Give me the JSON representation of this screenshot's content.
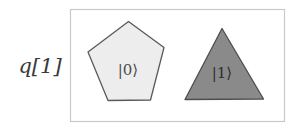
{
  "figure": {
    "title": "",
    "background_color": "#ffffff"
  },
  "qubit": {
    "label": "q[1]",
    "name": "q[1]"
  },
  "frame": {
    "name": "state-box",
    "border_color": "#c8c8c8",
    "fill_color": "#ffffff",
    "x": 70,
    "y": 9,
    "width": 215,
    "height": 113
  },
  "states": [
    {
      "id": "state-zero",
      "label": "|0⟩",
      "shape": "pentagon",
      "fill_color": "#ededed",
      "stroke_color": "#555555",
      "label_color": "#4a4a4a"
    },
    {
      "id": "state-one",
      "label": "|1⟩",
      "shape": "triangle",
      "fill_color": "#8a8a8a",
      "stroke_color": "#4a4a4a",
      "label_color": "#2e2e2e"
    }
  ]
}
